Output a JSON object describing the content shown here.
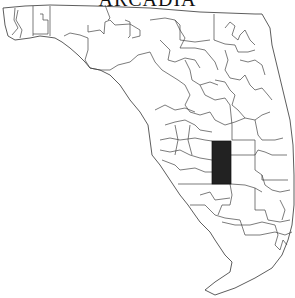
{
  "map": {
    "title": "ARCADIA",
    "region": "Florida",
    "highlighted_county": {
      "name": "DeSoto County",
      "fill": "#222222"
    },
    "colors": {
      "background": "#ffffff",
      "county_border": "#444444",
      "highlight": "#222222"
    }
  }
}
